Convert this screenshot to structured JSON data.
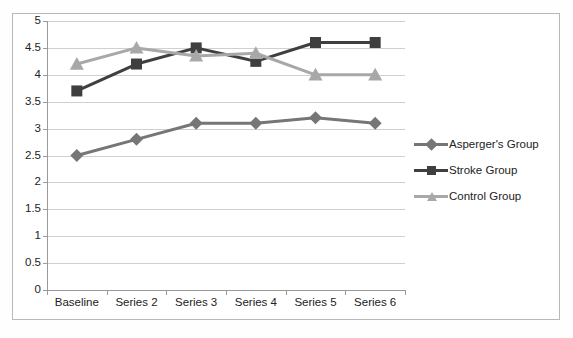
{
  "chart_data": {
    "type": "line",
    "title": "",
    "xlabel": "",
    "ylabel": "",
    "categories": [
      "Baseline",
      "Series 2",
      "Series 3",
      "Series 4",
      "Series 5",
      "Series 6"
    ],
    "ylim": [
      0,
      5
    ],
    "yticks": [
      "5",
      "4.5",
      "4",
      "3.5",
      "3",
      "2.5",
      "2",
      "1.5",
      "1",
      "0.5",
      "0"
    ],
    "ytick_values": [
      5,
      4.5,
      4,
      3.5,
      3,
      2.5,
      2,
      1.5,
      1,
      0.5,
      0
    ],
    "grid": true,
    "legend_position": "right",
    "series": [
      {
        "name": "Asperger's Group",
        "values": [
          2.5,
          2.8,
          3.1,
          3.1,
          3.2,
          3.1
        ],
        "color": "#767676",
        "marker": "diamond"
      },
      {
        "name": "Stroke Group",
        "values": [
          3.7,
          4.2,
          4.5,
          4.25,
          4.6,
          4.6
        ],
        "color": "#3f3f3f",
        "marker": "square"
      },
      {
        "name": "Control Group",
        "values": [
          4.2,
          4.5,
          4.35,
          4.4,
          4.0,
          4.0
        ],
        "color": "#a8a8a8",
        "marker": "triangle"
      }
    ]
  },
  "legend": {
    "items": [
      {
        "label": "Asperger's Group"
      },
      {
        "label": "Stroke Group"
      },
      {
        "label": "Control Group"
      }
    ]
  }
}
